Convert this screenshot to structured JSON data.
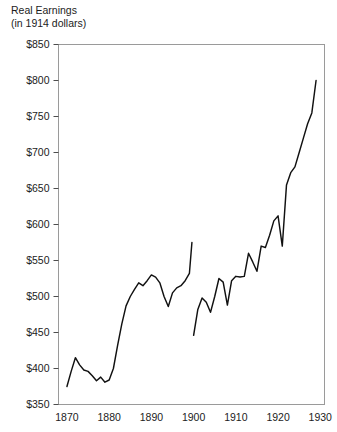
{
  "chart_data": {
    "type": "line",
    "title": "Real Earnings",
    "subtitle": "(in 1914 dollars)",
    "xlabel": "",
    "ylabel": "",
    "xlim": [
      1868,
      1931
    ],
    "ylim": [
      350,
      850
    ],
    "grid": false,
    "legend": "none",
    "y_ticks": [
      350,
      400,
      450,
      500,
      550,
      600,
      650,
      700,
      750,
      800,
      850
    ],
    "y_tick_labels": [
      "$350",
      "$400",
      "$450",
      "$500",
      "$550",
      "$600",
      "$650",
      "$700",
      "$750",
      "$800",
      "$850"
    ],
    "x_ticks": [
      1870,
      1880,
      1890,
      1900,
      1910,
      1920,
      1930
    ],
    "x_tick_labels": [
      "1870",
      "1880",
      "1890",
      "1900",
      "1910",
      "1920",
      "1930"
    ],
    "series": [
      {
        "name": "Real earnings 1870-1899",
        "x": [
          1870,
          1871,
          1872,
          1873,
          1874,
          1875,
          1876,
          1877,
          1878,
          1879,
          1880,
          1881,
          1882,
          1883,
          1884,
          1885,
          1886,
          1887,
          1888,
          1889,
          1890,
          1891,
          1892,
          1893,
          1894,
          1895,
          1896,
          1897,
          1898,
          1899
        ],
        "values": [
          375,
          396,
          415,
          405,
          398,
          396,
          390,
          383,
          388,
          381,
          384,
          400,
          432,
          462,
          487,
          500,
          510,
          519,
          515,
          522,
          530,
          527,
          519,
          500,
          486,
          505,
          512,
          515,
          522,
          532
        ],
        "values_end": [
          1899,
          575
        ]
      },
      {
        "name": "Real earnings 1900-1929",
        "x": [
          1900,
          1901,
          1902,
          1903,
          1904,
          1905,
          1906,
          1907,
          1908,
          1909,
          1910,
          1911,
          1912,
          1913,
          1914,
          1915,
          1916,
          1917,
          1918,
          1919,
          1920,
          1921,
          1922,
          1923,
          1924,
          1925,
          1926,
          1927,
          1928,
          1929
        ],
        "values": [
          446,
          482,
          498,
          492,
          478,
          500,
          525,
          520,
          488,
          522,
          528,
          527,
          528,
          560,
          548,
          535,
          570,
          568,
          585,
          605,
          612,
          570,
          655,
          672,
          680,
          700,
          720,
          740,
          755,
          800
        ]
      }
    ]
  }
}
